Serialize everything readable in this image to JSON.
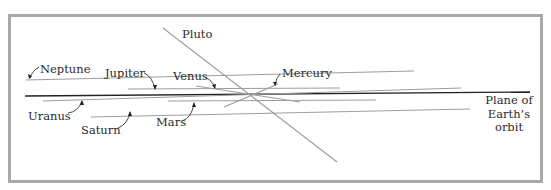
{
  "diagram": {
    "type": "orbital-inclination",
    "frame_color": "#a9a9a9",
    "line_color": "#9a9a9a",
    "plane_color": "#222222",
    "labels": {
      "pluto": "Pluto",
      "neptune": "Neptune",
      "jupiter": "Jupiter",
      "venus": "Venus",
      "mercury": "Mercury",
      "uranus": "Uranus",
      "saturn": "Saturn",
      "mars": "Mars",
      "plane_line1": "Plane of",
      "plane_line2": "Earth’s",
      "plane_line3": "orbit"
    }
  }
}
